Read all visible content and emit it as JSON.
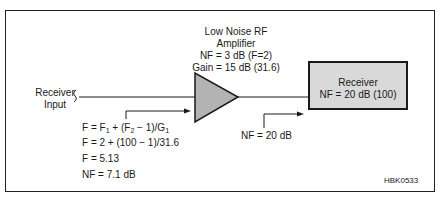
{
  "amplifier": {
    "title_line1": "Low Noise RF",
    "title_line2": "Amplifier",
    "nf_line": "NF = 3 dB (F=2)",
    "gain_line": "Gain = 15 dB (31.6)",
    "fill_color": "#b3b3b3"
  },
  "receiver": {
    "title": "Receiver",
    "nf_line": "NF = 20 dB (100)",
    "fill_color": "#d9d9d9"
  },
  "input_label": {
    "line1": "Receiver",
    "line2": "Input"
  },
  "receiver_nf_callout": "NF = 20 dB",
  "equations": {
    "eq1": {
      "a": "F = F",
      "s1": "1",
      "b": " + (F",
      "s2": "2",
      "c": " − 1)/G",
      "s3": "1"
    },
    "eq2": "F = 2 + (100 − 1)/31.6",
    "eq3": "F = 5.13",
    "eq4": "NF = 7.1 dB"
  },
  "figure_id": "HBK0533"
}
